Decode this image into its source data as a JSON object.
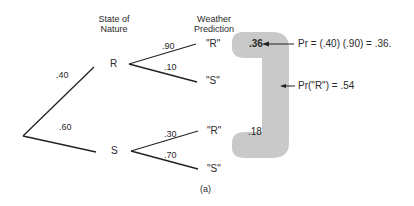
{
  "headers": {
    "state_of_nature": [
      "State of",
      "Nature"
    ],
    "weather_prediction": [
      "Weather",
      "Prediction"
    ]
  },
  "nodes": {
    "state_r": "R",
    "state_s": "S"
  },
  "branch_probs": {
    "root_to_r": ".40",
    "root_to_s": ".60",
    "r_to_r": ".90",
    "r_to_s": ".10",
    "s_to_r": ".30",
    "s_to_s": ".70"
  },
  "predictions": {
    "r_r": "\"R\"",
    "r_s": "\"S\"",
    "s_r": "\"R\"",
    "s_s": "\"S\""
  },
  "joint_values": {
    "rr": ".36",
    "sr": ".18"
  },
  "annotations": {
    "joint_formula": "Pr = (.40) (.90) = .36.",
    "marginal": "Pr(\"R\") = .54"
  },
  "caption": "(a)",
  "colors": {
    "line": "#222222",
    "highlight": "#c9c9c9"
  }
}
